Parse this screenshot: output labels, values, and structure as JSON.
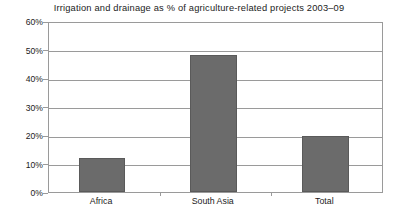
{
  "chart_data": {
    "type": "bar",
    "title": "Irrigation and drainage as % of agriculture-related projects 2003–09",
    "xlabel": "",
    "ylabel": "",
    "categories": [
      "Africa",
      "South Asia",
      "Total"
    ],
    "values": [
      12,
      48,
      19.5
    ],
    "ylim": [
      0,
      60
    ],
    "ytick_labels": [
      "0%",
      "10%",
      "20%",
      "30%",
      "40%",
      "50%",
      "60%"
    ],
    "ytick_values": [
      0,
      10,
      20,
      30,
      40,
      50,
      60
    ],
    "grid": true,
    "legend": false,
    "legend_position": "none",
    "series": [
      {
        "name": "Irrigation and drainage share",
        "values": [
          12,
          48,
          19.5
        ],
        "color": "#6b6b6b"
      }
    ],
    "colors": {
      "bar_fill": "#6b6b6b",
      "bar_border": "#5a5a5a",
      "gridline": "#9a9a9a",
      "axis": "#9a9a9a",
      "text": "#1b1b1b",
      "background": "#ffffff"
    }
  }
}
